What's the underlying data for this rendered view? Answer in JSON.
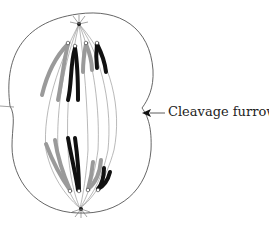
{
  "diagram": {
    "labels": {
      "cleavage_furrow": "Cleavage furrow"
    },
    "colors": {
      "outline": "#555555",
      "spindle": "#888888",
      "chromosome_dark": "#111111",
      "chromosome_light": "#9a9a9a",
      "arrow": "#222222"
    }
  }
}
